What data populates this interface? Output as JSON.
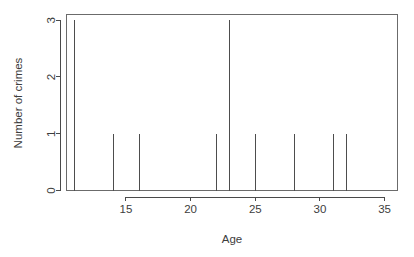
{
  "chart_data": {
    "type": "bar",
    "title": "",
    "subtitle": "",
    "xlabel": "Age",
    "ylabel": "Number of crimes",
    "categories": [
      11,
      14,
      16,
      22,
      23,
      25,
      28,
      31,
      32
    ],
    "values": [
      3,
      1,
      1,
      1,
      3,
      1,
      1,
      1,
      1
    ],
    "x": [
      11,
      14,
      16,
      22,
      23,
      25,
      28,
      31,
      32
    ],
    "series": [
      {
        "name": "Number of crimes",
        "values": [
          3,
          1,
          1,
          1,
          3,
          1,
          1,
          1,
          1
        ]
      }
    ],
    "xlim": [
      10.4,
      36.0
    ],
    "ylim": [
      0,
      3.1
    ],
    "xticks": [
      15,
      20,
      25,
      30,
      35
    ],
    "xtick_labels": [
      "15",
      "20",
      "25",
      "30",
      "35"
    ],
    "yticks": [
      0,
      1,
      2,
      3
    ],
    "ytick_labels": [
      "0",
      "1",
      "2",
      "3"
    ],
    "grid": false,
    "legend": false,
    "legend_position": "none",
    "frame": true,
    "style": "r-base-spike-plot"
  },
  "axes": {
    "x_title": "Age",
    "y_title": "Number of crimes"
  },
  "colors": {
    "line": "#4d4d4d",
    "frame": "#6b6b6b",
    "text": "#3d3d3d",
    "background": "#ffffff"
  }
}
